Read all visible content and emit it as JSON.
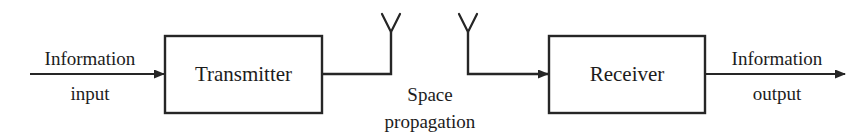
{
  "diagram": {
    "type": "block-diagram",
    "background_color": "#ffffff",
    "line_color": "#262626",
    "text_color": "#1c1c1c",
    "blocks": [
      {
        "id": "transmitter",
        "label": "Transmitter"
      },
      {
        "id": "receiver",
        "label": "Receiver"
      }
    ],
    "signals": {
      "input_line1": "Information",
      "input_line2": "input",
      "output_line1": "Information",
      "output_line2": "output"
    },
    "channel": {
      "line1": "Space",
      "line2": "propagation"
    },
    "antennas": [
      {
        "id": "transmit-antenna",
        "shape": "Y"
      },
      {
        "id": "receive-antenna",
        "shape": "Y"
      }
    ]
  }
}
